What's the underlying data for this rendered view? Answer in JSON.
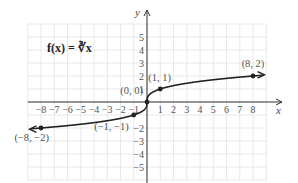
{
  "chart_data": {
    "type": "line",
    "title": "f(x) = ∛x",
    "formula_label": "f(x) = ∛x",
    "xlabel": "x",
    "ylabel": "y",
    "xlim": [
      -9,
      9
    ],
    "ylim": [
      -6,
      6
    ],
    "grid": true,
    "x_ticks": [
      -8,
      -7,
      -6,
      -5,
      -4,
      -3,
      -2,
      -1,
      1,
      2,
      3,
      4,
      5,
      6,
      7,
      8
    ],
    "y_ticks": [
      -5,
      -4,
      -3,
      -2,
      -1,
      1,
      2,
      3,
      4,
      5
    ],
    "x_tick_labels": [
      "−8",
      "−7",
      "−6",
      "−5",
      "−4",
      "−3",
      "−2",
      "−1",
      "1",
      "2",
      "3",
      "4",
      "5",
      "6",
      "7",
      "8"
    ],
    "y_tick_labels": [
      "−5",
      "−4",
      "−3",
      "−2",
      "1",
      "2",
      "3",
      "4",
      "5"
    ],
    "series": [
      {
        "name": "f(x) = cube root of x",
        "color": "#222222",
        "x": [
          -9,
          -8,
          -1,
          0,
          1,
          8,
          9
        ],
        "y": [
          -2.08,
          -2,
          -1,
          0,
          1,
          2,
          2.08
        ]
      }
    ],
    "points": [
      {
        "x": -8,
        "y": -2,
        "label": "(−8, −2)"
      },
      {
        "x": -1,
        "y": -1,
        "label": "(−1, −1)"
      },
      {
        "x": 0,
        "y": 0,
        "label": "(0, 0)"
      },
      {
        "x": 1,
        "y": 1,
        "label": "(1, 1)"
      },
      {
        "x": 8,
        "y": 2,
        "label": "(8, 2)"
      }
    ]
  }
}
